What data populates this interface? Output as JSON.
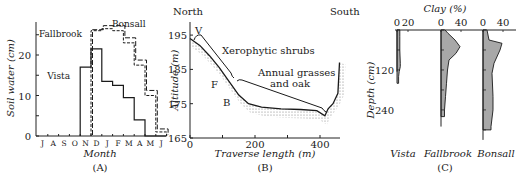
{
  "figure": {
    "panel_labels": [
      "(A)",
      "(B)",
      "(C)"
    ]
  },
  "chart_data": [
    {
      "panel": "(A)",
      "type": "line",
      "style": "step",
      "title": "",
      "xlabel": "Month",
      "ylabel": "Soil water (cm)",
      "categories": [
        "J",
        "A",
        "S",
        "O",
        "N",
        "D",
        "J",
        "F",
        "M",
        "A",
        "M",
        "J"
      ],
      "yticks": [
        0,
        10,
        20
      ],
      "ylim": [
        0,
        28
      ],
      "series": [
        {
          "name": "Vista",
          "style": "solid",
          "values": [
            0,
            0,
            0,
            0,
            17,
            21.5,
            13.5,
            12.5,
            9.5,
            4,
            0,
            0
          ]
        },
        {
          "name": "Fallbrook",
          "style": "dashed",
          "values": [
            0,
            0,
            0,
            0,
            0,
            26,
            26.5,
            26,
            23,
            17.5,
            10,
            1
          ]
        },
        {
          "name": "Bonsall",
          "style": "dashed",
          "values": [
            0,
            0,
            0,
            0,
            0,
            26,
            27,
            27,
            24,
            18.5,
            11,
            1.5
          ]
        }
      ],
      "annotations": [
        "Fallbrook",
        "Bonsall",
        "Vista"
      ]
    },
    {
      "panel": "(B)",
      "type": "line",
      "title": "",
      "xlabel": "Traverse length (m)",
      "ylabel": "Altitude (m)",
      "xticks": [
        0,
        200,
        400
      ],
      "yticks": [
        165,
        175,
        185,
        195
      ],
      "xlim": [
        0,
        460
      ],
      "ylim": [
        165,
        198
      ],
      "corner_labels": {
        "left": "North",
        "right": "South"
      },
      "series": [
        {
          "name": "Ground surface",
          "x": [
            0,
            30,
            60,
            90,
            120,
            150,
            180,
            220,
            280,
            340,
            390,
            415,
            425,
            440,
            455,
            460
          ],
          "y": [
            194,
            192,
            189,
            185.5,
            181.5,
            177.5,
            175,
            174,
            173.5,
            173.3,
            173,
            171.5,
            173.5,
            175,
            178,
            187
          ]
        }
      ],
      "annotations": [
        "V",
        "F",
        "B",
        "Xerophytic shrubs",
        "Annual grasses and oak"
      ]
    },
    {
      "panel": "(C)",
      "type": "area",
      "title": "Clay (%)",
      "ylabel": "Depth (cm)",
      "yticks": [
        0,
        120,
        240
      ],
      "ylim": [
        0,
        320
      ],
      "series": [
        {
          "name": "Vista",
          "xticks": [
            0,
            20
          ],
          "depth": [
            0,
            20,
            60,
            100,
            110,
            125,
            140,
            160
          ],
          "clay": [
            5,
            5,
            5,
            6,
            6,
            4,
            3,
            3
          ]
        },
        {
          "name": "Fallbrook",
          "xticks": [
            0,
            40
          ],
          "depth": [
            0,
            10,
            30,
            50,
            70,
            90,
            120,
            160,
            200,
            240,
            260
          ],
          "clay": [
            8,
            14,
            28,
            38,
            30,
            16,
            13,
            11,
            9,
            7,
            7
          ]
        },
        {
          "name": "Bonsall",
          "xticks": [
            0,
            40
          ],
          "depth": [
            0,
            30,
            40,
            60,
            100,
            130,
            200,
            240,
            290,
            300
          ],
          "clay": [
            8,
            12,
            38,
            34,
            22,
            18,
            20,
            20,
            16,
            16
          ]
        }
      ]
    }
  ]
}
